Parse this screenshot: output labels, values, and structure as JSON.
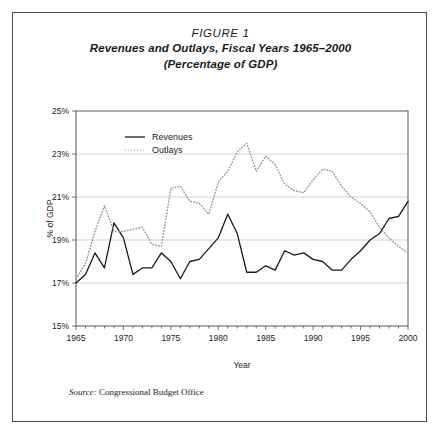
{
  "figure": {
    "label": "FIGURE 1",
    "subtitle_line1": "Revenues and Outlays, Fiscal Years 1965–2000",
    "subtitle_line2": "(Percentage of GDP)",
    "source_label": "Source:",
    "source_text": "Congressional Budget Office"
  },
  "chart_data": {
    "type": "line",
    "title": "Revenues and Outlays, Fiscal Years 1965–2000 (Percentage of GDP)",
    "xlabel": "Year",
    "ylabel": "% of GDP",
    "xlim": [
      1965,
      2000
    ],
    "ylim": [
      15,
      25
    ],
    "ytick_labels": [
      "25%",
      "23%",
      "21%",
      "19%",
      "17%",
      "15%"
    ],
    "ytick_values": [
      25,
      23,
      21,
      19,
      17,
      15
    ],
    "xtick_labels": [
      "1965",
      "1970",
      "1975",
      "1980",
      "1985",
      "1990",
      "1995",
      "2000"
    ],
    "xtick_values": [
      1965,
      1970,
      1975,
      1980,
      1985,
      1990,
      1995,
      2000
    ],
    "minor_xticks": true,
    "grid": "horizontal",
    "legend_position": "top-left-inside",
    "x": [
      1965,
      1966,
      1967,
      1968,
      1969,
      1970,
      1971,
      1972,
      1973,
      1974,
      1975,
      1976,
      1977,
      1978,
      1979,
      1980,
      1981,
      1982,
      1983,
      1984,
      1985,
      1986,
      1987,
      1988,
      1989,
      1990,
      1991,
      1992,
      1993,
      1994,
      1995,
      1996,
      1997,
      1998,
      1999,
      2000
    ],
    "series": [
      {
        "name": "Revenues",
        "style": "solid",
        "color": "#1a1a1a",
        "values": [
          17.0,
          17.4,
          18.4,
          17.7,
          19.8,
          19.1,
          17.4,
          17.7,
          17.7,
          18.4,
          18.0,
          17.2,
          18.0,
          18.1,
          18.6,
          19.1,
          20.2,
          19.3,
          17.5,
          17.5,
          17.8,
          17.6,
          18.5,
          18.3,
          18.4,
          18.1,
          18.0,
          17.6,
          17.6,
          18.1,
          18.5,
          19.0,
          19.3,
          20.0,
          20.1,
          20.8
        ]
      },
      {
        "name": "Outlays",
        "style": "dotted",
        "color": "#9a9a9a",
        "values": [
          17.2,
          17.9,
          19.4,
          20.6,
          19.4,
          19.4,
          19.5,
          19.6,
          18.8,
          18.7,
          21.4,
          21.5,
          20.8,
          20.7,
          20.2,
          21.7,
          22.2,
          23.1,
          23.5,
          22.2,
          22.9,
          22.5,
          21.6,
          21.3,
          21.2,
          21.8,
          22.3,
          22.2,
          21.5,
          21.0,
          20.7,
          20.3,
          19.6,
          19.1,
          18.7,
          18.4
        ]
      }
    ]
  },
  "legend": [
    {
      "label": "Revenues",
      "style": "solid"
    },
    {
      "label": "Outlays",
      "style": "dotted"
    }
  ]
}
